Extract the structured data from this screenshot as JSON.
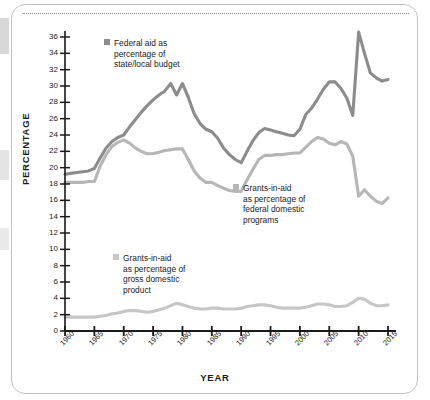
{
  "chart_data": {
    "type": "line",
    "title": "",
    "xlabel": "YEAR",
    "ylabel": "PERCENTAGE",
    "xlim": [
      1960,
      2015
    ],
    "ylim": [
      0,
      36
    ],
    "ytick_step": 2,
    "grid": false,
    "legend_position": "inline-plot",
    "ytick_labels": [
      "0",
      "2",
      "4",
      "6",
      "8",
      "10",
      "12",
      "14",
      "16",
      "18",
      "20",
      "22",
      "24",
      "26",
      "28",
      "30",
      "32",
      "34",
      "36"
    ],
    "xtick_labels": [
      "1960",
      "1965",
      "1970",
      "1975",
      "1980",
      "1985",
      "1990",
      "1995",
      "2000",
      "2005",
      "2010",
      "2015"
    ],
    "x": [
      1960,
      1961,
      1962,
      1963,
      1964,
      1965,
      1966,
      1967,
      1968,
      1969,
      1970,
      1971,
      1972,
      1973,
      1974,
      1975,
      1976,
      1977,
      1978,
      1979,
      1980,
      1981,
      1982,
      1983,
      1984,
      1985,
      1986,
      1987,
      1988,
      1989,
      1990,
      1991,
      1992,
      1993,
      1994,
      1995,
      1996,
      1997,
      1998,
      1999,
      2000,
      2001,
      2002,
      2003,
      2004,
      2005,
      2006,
      2007,
      2008,
      2009,
      2010,
      2011,
      2012,
      2013,
      2014,
      2015
    ],
    "series": [
      {
        "name": "Federal aid as percentage of state/local budget",
        "color": "#8c8c8c",
        "values": [
          19.2,
          19.3,
          19.4,
          19.5,
          19.6,
          19.9,
          21.2,
          22.4,
          23.2,
          23.7,
          24.0,
          25.0,
          25.9,
          26.8,
          27.6,
          28.3,
          28.9,
          29.4,
          30.3,
          28.9,
          30.3,
          28.6,
          26.6,
          25.4,
          24.7,
          24.4,
          23.6,
          22.4,
          21.6,
          21.0,
          20.6,
          22.0,
          23.3,
          24.3,
          24.8,
          24.6,
          24.4,
          24.2,
          24.0,
          23.9,
          24.7,
          26.5,
          27.3,
          28.4,
          29.6,
          30.5,
          30.5,
          29.7,
          28.5,
          26.4,
          36.6,
          34.0,
          31.6,
          31.0,
          30.6,
          30.8
        ]
      },
      {
        "name": "Grants-in-aid as percentage of federal domestic programs",
        "color": "#b6b6b6",
        "values": [
          18.2,
          18.2,
          18.2,
          18.2,
          18.3,
          18.3,
          20.2,
          21.6,
          22.6,
          23.1,
          23.4,
          23.0,
          22.4,
          22.0,
          21.7,
          21.7,
          21.9,
          22.1,
          22.2,
          22.3,
          22.3,
          21.0,
          19.6,
          18.7,
          18.2,
          18.2,
          17.8,
          17.5,
          17.2,
          17.1,
          17.1,
          18.5,
          19.8,
          21.0,
          21.5,
          21.5,
          21.6,
          21.6,
          21.7,
          21.8,
          21.8,
          22.5,
          23.2,
          23.7,
          23.5,
          23.0,
          22.8,
          23.2,
          22.9,
          21.4,
          16.5,
          17.3,
          16.5,
          15.9,
          15.6,
          16.3
        ]
      },
      {
        "name": "Grants-in-aid as percentage of gross domestic product",
        "color": "#c6c6c6",
        "values": [
          1.7,
          1.7,
          1.7,
          1.7,
          1.7,
          1.7,
          1.8,
          1.9,
          2.1,
          2.2,
          2.4,
          2.5,
          2.5,
          2.4,
          2.3,
          2.4,
          2.6,
          2.8,
          3.1,
          3.4,
          3.2,
          3.0,
          2.8,
          2.7,
          2.7,
          2.8,
          2.8,
          2.7,
          2.7,
          2.7,
          2.8,
          3.0,
          3.1,
          3.2,
          3.2,
          3.1,
          2.9,
          2.8,
          2.8,
          2.8,
          2.8,
          2.9,
          3.1,
          3.3,
          3.3,
          3.2,
          3.0,
          3.0,
          3.1,
          3.5,
          4.0,
          3.9,
          3.4,
          3.1,
          3.1,
          3.2
        ]
      }
    ],
    "legend_blocks": [
      {
        "key": "federal-aid-state-local",
        "color": "#8c8c8c",
        "lines": [
          "Federal aid as",
          "percentage of",
          "state/local budget"
        ]
      },
      {
        "key": "grants-federal-domestic",
        "color": "#b6b6b6",
        "lines": [
          "Grants-in-aid",
          "as percentage of",
          "federal domestic",
          "programs"
        ]
      },
      {
        "key": "grants-gdp",
        "color": "#c6c6c6",
        "lines": [
          "Grants-in-aid",
          "as percentage of",
          "gross domestic",
          "product"
        ]
      }
    ]
  }
}
